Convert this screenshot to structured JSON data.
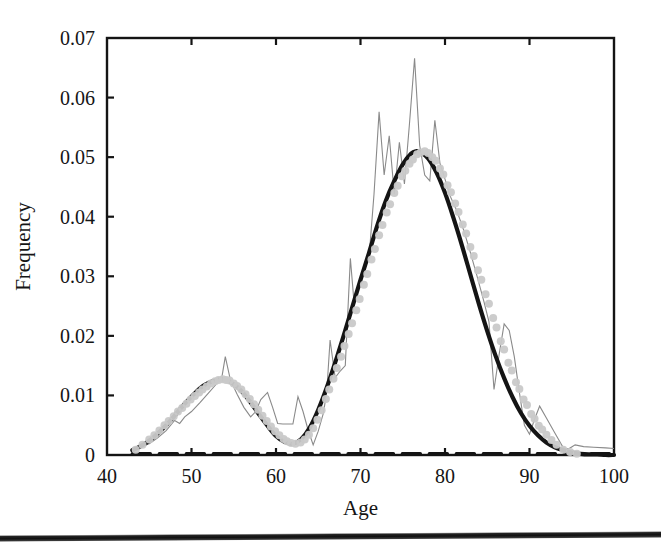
{
  "figure": {
    "background_color": "#ffffff",
    "scan_edge_bar_color": "#111111"
  },
  "chart_data": {
    "type": "line",
    "title": "",
    "subtitle": "",
    "xlabel": "Age",
    "ylabel": "Frequency",
    "xlim": [
      40,
      100
    ],
    "ylim": [
      0,
      0.07
    ],
    "xticks": [
      40,
      50,
      60,
      70,
      80,
      90,
      100
    ],
    "xticklabels": [
      "40",
      "50",
      "60",
      "70",
      "80",
      "90",
      "100"
    ],
    "yticks": [
      0,
      0.01,
      0.02,
      0.03,
      0.04,
      0.05,
      0.06,
      0.07
    ],
    "yticklabels": [
      "0",
      "0.01",
      "0.02",
      "0.03",
      "0.04",
      "0.05",
      "0.06",
      "0.07"
    ],
    "grid": false,
    "legend": "none",
    "tick_direction": "in",
    "frame": "box",
    "annotations": [],
    "series": [
      {
        "name": "empirical-frequency-polygon",
        "type": "line",
        "color": "#8a8a8a",
        "linewidth": 1.1,
        "x": [
          43.0,
          44.0,
          45.0,
          46.0,
          47.0,
          48.0,
          48.6,
          49.2,
          50.0,
          51.0,
          52.0,
          53.0,
          53.6,
          54.0,
          54.6,
          55.4,
          56.2,
          57.0,
          57.6,
          58.2,
          59.0,
          59.6,
          60.2,
          60.8,
          61.4,
          62.0,
          62.6,
          63.2,
          63.8,
          64.4,
          65.0,
          65.6,
          66.0,
          66.4,
          67.0,
          67.6,
          68.2,
          68.8,
          69.2,
          69.6,
          70.2,
          71.0,
          71.6,
          72.2,
          72.8,
          73.4,
          74.0,
          74.6,
          75.2,
          75.8,
          76.4,
          77.0,
          77.6,
          78.2,
          78.8,
          79.4,
          80.0,
          80.6,
          81.4,
          82.2,
          83.0,
          83.8,
          84.6,
          85.2,
          85.8,
          86.4,
          87.0,
          87.6,
          88.2,
          88.8,
          89.4,
          90.0,
          90.6,
          91.2,
          92.0,
          93.0,
          94.0,
          94.6,
          95.4,
          96.4,
          97.6,
          99.0,
          100.0
        ],
        "y": [
          0.0005,
          0.0014,
          0.0019,
          0.0029,
          0.0041,
          0.0058,
          0.0053,
          0.0064,
          0.0073,
          0.0088,
          0.0104,
          0.012,
          0.0131,
          0.0165,
          0.0126,
          0.0102,
          0.008,
          0.0064,
          0.0073,
          0.0093,
          0.0105,
          0.008,
          0.0053,
          0.0052,
          0.0052,
          0.0052,
          0.0098,
          0.0073,
          0.0042,
          0.0017,
          0.004,
          0.007,
          0.0105,
          0.0193,
          0.013,
          0.0141,
          0.015,
          0.033,
          0.0262,
          0.028,
          0.0305,
          0.033,
          0.0438,
          0.0576,
          0.047,
          0.0536,
          0.0438,
          0.0525,
          0.0455,
          0.0557,
          0.0666,
          0.052,
          0.047,
          0.046,
          0.0562,
          0.049,
          0.0463,
          0.0435,
          0.041,
          0.0378,
          0.034,
          0.03,
          0.0258,
          0.0224,
          0.011,
          0.0168,
          0.022,
          0.0209,
          0.0165,
          0.0105,
          0.005,
          0.0035,
          0.006,
          0.0082,
          0.0062,
          0.0037,
          0.0012,
          0.001,
          0.0017,
          0.0014,
          0.0013,
          0.0012,
          0.0011
        ]
      },
      {
        "name": "mixture-fit-smooth-curve",
        "type": "line",
        "color": "#141414",
        "linewidth": 4.2,
        "x": [
          43.0,
          44.0,
          45.0,
          46.0,
          47.0,
          48.0,
          49.0,
          50.0,
          51.0,
          52.0,
          53.0,
          53.6,
          54.0,
          55.0,
          56.0,
          57.0,
          58.0,
          59.0,
          60.0,
          61.0,
          62.0,
          63.0,
          64.0,
          65.0,
          66.0,
          67.0,
          68.0,
          69.0,
          70.0,
          71.0,
          72.0,
          73.0,
          74.0,
          75.0,
          76.0,
          76.6,
          77.0,
          78.0,
          79.0,
          80.0,
          81.0,
          82.0,
          83.0,
          84.0,
          85.0,
          86.0,
          87.0,
          88.0,
          89.0,
          90.0,
          91.0,
          92.0,
          93.0,
          94.0,
          95.0,
          96.0,
          97.0,
          98.0,
          99.0,
          100.0
        ],
        "y": [
          0.0008,
          0.0015,
          0.0024,
          0.0036,
          0.005,
          0.0066,
          0.0083,
          0.0098,
          0.0112,
          0.0121,
          0.0126,
          0.0127,
          0.0126,
          0.0119,
          0.0106,
          0.0088,
          0.0068,
          0.0049,
          0.0032,
          0.0022,
          0.0019,
          0.0027,
          0.0046,
          0.0076,
          0.0113,
          0.0155,
          0.02,
          0.0247,
          0.0294,
          0.0339,
          0.0386,
          0.0427,
          0.046,
          0.0488,
          0.0506,
          0.051,
          0.0509,
          0.0498,
          0.0474,
          0.044,
          0.0398,
          0.0352,
          0.0303,
          0.0254,
          0.0208,
          0.0166,
          0.0129,
          0.0097,
          0.007,
          0.0049,
          0.0033,
          0.0021,
          0.0013,
          0.0008,
          0.0004,
          0.0002,
          0.0001,
          0.0001,
          0.0,
          0.0
        ]
      },
      {
        "name": "component-baseline-curve",
        "type": "line",
        "color": "#141414",
        "linewidth": 3.4,
        "x": [
          43.0,
          48.0,
          53.0,
          58.0,
          61.0,
          63.0,
          66.0,
          70.0,
          75.0,
          80.0,
          85.0,
          90.0,
          95.0,
          100.0
        ],
        "y": [
          0.0002,
          0.0002,
          0.0002,
          0.0002,
          0.0002,
          0.0002,
          0.0002,
          0.0002,
          0.0002,
          0.0002,
          0.0002,
          0.0002,
          0.0002,
          0.0002
        ]
      },
      {
        "name": "observation-scatter-points",
        "type": "scatter",
        "color": "#c9c9c9",
        "marker_size": 4.0,
        "x": [
          43.4,
          44.2,
          45.0,
          45.6,
          46.2,
          46.8,
          47.3,
          47.9,
          48.4,
          48.9,
          49.4,
          49.9,
          50.4,
          50.9,
          51.3,
          51.8,
          52.3,
          52.8,
          53.2,
          53.7,
          54.1,
          54.5,
          55.0,
          55.4,
          55.9,
          56.4,
          56.9,
          57.4,
          57.9,
          58.4,
          58.9,
          59.4,
          59.9,
          60.4,
          60.9,
          61.3,
          61.8,
          62.3,
          62.9,
          63.4,
          63.9,
          64.4,
          64.9,
          65.4,
          65.9,
          66.3,
          66.8,
          67.2,
          67.7,
          68.1,
          68.6,
          69.0,
          69.5,
          69.9,
          70.4,
          70.8,
          71.3,
          71.7,
          72.2,
          72.6,
          73.1,
          73.5,
          74.0,
          74.4,
          74.9,
          75.3,
          75.8,
          76.2,
          76.7,
          77.1,
          77.6,
          78.0,
          78.5,
          78.9,
          79.4,
          79.8,
          80.3,
          80.7,
          81.2,
          81.6,
          82.1,
          82.5,
          83.0,
          83.4,
          83.9,
          84.3,
          84.8,
          85.2,
          85.7,
          86.1,
          86.6,
          87.0,
          87.5,
          87.9,
          88.4,
          88.8,
          89.3,
          89.7,
          90.2,
          90.6,
          91.1,
          91.5,
          92.0,
          92.6,
          93.2,
          94.0,
          94.8,
          95.6
        ],
        "y": [
          0.0009,
          0.0017,
          0.0026,
          0.0033,
          0.0041,
          0.005,
          0.0057,
          0.0065,
          0.0073,
          0.0079,
          0.0086,
          0.0093,
          0.0099,
          0.0105,
          0.011,
          0.0115,
          0.012,
          0.0124,
          0.0126,
          0.0127,
          0.0126,
          0.0125,
          0.012,
          0.0116,
          0.011,
          0.0102,
          0.0094,
          0.0085,
          0.0076,
          0.0066,
          0.0057,
          0.0048,
          0.004,
          0.0033,
          0.0027,
          0.0023,
          0.002,
          0.0019,
          0.0021,
          0.0026,
          0.0034,
          0.0045,
          0.0059,
          0.0075,
          0.0094,
          0.011,
          0.0128,
          0.0146,
          0.0165,
          0.0183,
          0.0203,
          0.0221,
          0.0243,
          0.0262,
          0.0286,
          0.0304,
          0.0328,
          0.0346,
          0.0369,
          0.0386,
          0.0407,
          0.0421,
          0.044,
          0.0452,
          0.0468,
          0.0477,
          0.0489,
          0.0496,
          0.0505,
          0.0508,
          0.051,
          0.0507,
          0.05,
          0.0494,
          0.0481,
          0.0471,
          0.0453,
          0.0441,
          0.0422,
          0.0408,
          0.0387,
          0.0372,
          0.0349,
          0.0334,
          0.031,
          0.0294,
          0.027,
          0.0254,
          0.023,
          0.0214,
          0.0191,
          0.0177,
          0.0155,
          0.0142,
          0.0122,
          0.0111,
          0.0093,
          0.0084,
          0.0069,
          0.0061,
          0.0049,
          0.0043,
          0.0034,
          0.0025,
          0.0017,
          0.0009,
          0.0005,
          0.0002
        ]
      }
    ]
  }
}
